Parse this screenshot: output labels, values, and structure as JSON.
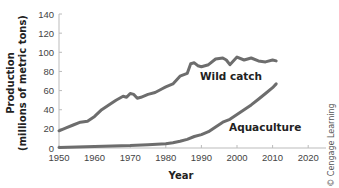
{
  "chart_data": {
    "type": "line",
    "title": "",
    "xlabel": "Year",
    "ylabel": "Production (millions of metric tons)",
    "ylabel_line1": "Production",
    "ylabel_line2": "(millions of metric tons)",
    "xlim": [
      1950,
      2025
    ],
    "ylim": [
      0,
      140
    ],
    "x_ticks": [
      1950,
      1960,
      1970,
      1980,
      1990,
      2000,
      2010,
      2020
    ],
    "y_ticks": [
      0,
      20,
      40,
      60,
      80,
      100,
      120,
      140
    ],
    "grid": false,
    "legend_position": "inline labels",
    "series": [
      {
        "name": "Wild catch",
        "color": "#6d6d6d",
        "x": [
          1950,
          1952,
          1954,
          1956,
          1958,
          1960,
          1962,
          1964,
          1966,
          1968,
          1969,
          1970,
          1971,
          1972,
          1973,
          1975,
          1977,
          1979,
          1980,
          1982,
          1984,
          1986,
          1987,
          1988,
          1989,
          1990,
          1992,
          1994,
          1996,
          1997,
          1998,
          2000,
          2002,
          2004,
          2006,
          2008,
          2010,
          2011
        ],
        "values": [
          18,
          21,
          24,
          27,
          28,
          33,
          40,
          45,
          50,
          54,
          53,
          57,
          56,
          52,
          53,
          56,
          58,
          62,
          64,
          67,
          75,
          78,
          88,
          89,
          86,
          85,
          87,
          93,
          94,
          92,
          87,
          95,
          92,
          94,
          91,
          90,
          92,
          91
        ]
      },
      {
        "name": "Aquaculture",
        "color": "#6d6d6d",
        "x": [
          1950,
          1955,
          1960,
          1965,
          1970,
          1975,
          1980,
          1982,
          1984,
          1986,
          1988,
          1990,
          1992,
          1994,
          1996,
          1998,
          2000,
          2002,
          2004,
          2006,
          2008,
          2010,
          2011
        ],
        "values": [
          0.5,
          1,
          1.5,
          2,
          2.5,
          3.5,
          4.5,
          5.5,
          7,
          9,
          12,
          14,
          17,
          22,
          27,
          30,
          35,
          40,
          45,
          51,
          57,
          63,
          67
        ]
      }
    ],
    "annotations": [
      "Wild catch",
      "Aquaculture"
    ]
  },
  "credit": "© Cengage Learning"
}
